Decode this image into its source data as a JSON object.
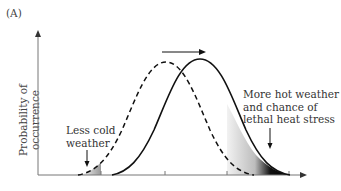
{
  "panel_label": "(A)",
  "y_axis_label": "Probability of occurrence",
  "annotations": {
    "cold": [
      "Less cold",
      "weather"
    ],
    "hot": [
      "More hot weather",
      "and chance of",
      "lethal heat stress"
    ]
  },
  "curves": {
    "original": {
      "style": "dashed",
      "peak_x": 166
    },
    "shifted": {
      "style": "solid",
      "peak_x": 200
    }
  },
  "shift_arrow": {
    "direction": "right"
  },
  "colors": {
    "line": "#111111",
    "axis": "#777777",
    "shade_dark": "#000000",
    "shade_light": "#e6e6e6"
  }
}
